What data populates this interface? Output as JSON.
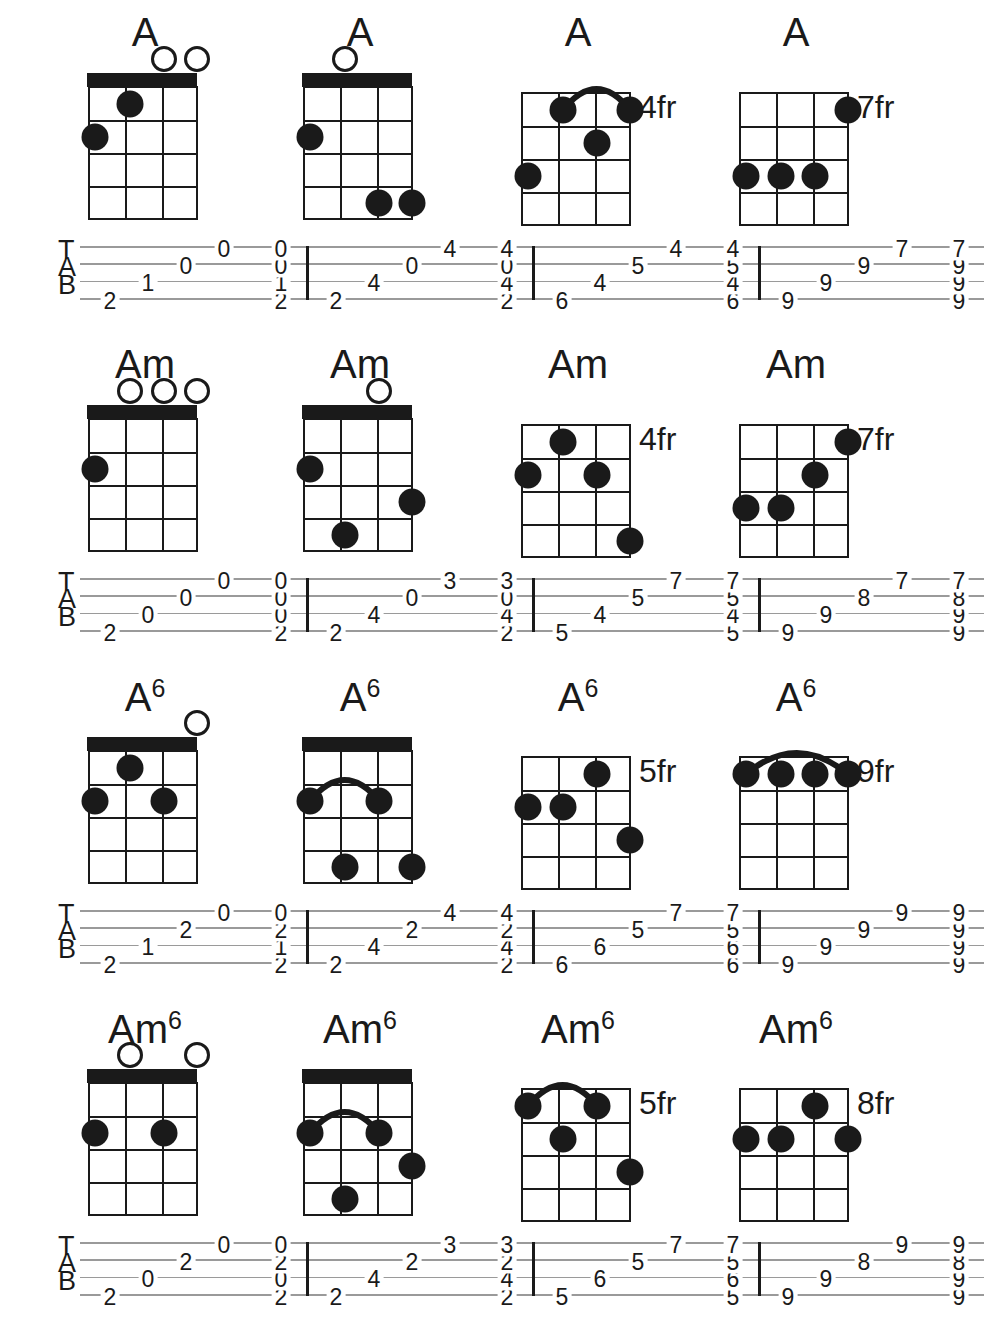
{
  "document": {
    "instrument_strings": 4,
    "diagram_frets": 4,
    "tab_letters": [
      "T",
      "A",
      "B"
    ],
    "colors": {
      "ink": "#1a1a1a",
      "staff_line": "#9a9a9a",
      "paper": "#ffffff"
    }
  },
  "rows": [
    {
      "name": "A-chord-row",
      "chords": [
        {
          "label": "A",
          "superscript": "",
          "position_label": "",
          "nut": true,
          "barre": null,
          "open_strings": [
            2,
            1
          ],
          "dots": [
            {
              "string": 4,
              "fret": 2
            },
            {
              "string": 3,
              "fret": 1
            }
          ],
          "tab": {
            "arpeggio": [
              2,
              1,
              0,
              0
            ],
            "block": [
              2,
              1,
              0,
              0
            ]
          }
        },
        {
          "label": "A",
          "superscript": "",
          "position_label": "",
          "nut": true,
          "barre": null,
          "open_strings": [
            3
          ],
          "dots": [
            {
              "string": 4,
              "fret": 2
            },
            {
              "string": 2,
              "fret": 4
            },
            {
              "string": 1,
              "fret": 4
            }
          ],
          "tab": {
            "arpeggio": [
              2,
              4,
              0,
              4
            ],
            "block": [
              2,
              4,
              0,
              4
            ]
          }
        },
        {
          "label": "A",
          "superscript": "",
          "position_label": "4fr",
          "nut": false,
          "barre": {
            "from_string": 3,
            "to_string": 1,
            "fret": 1
          },
          "open_strings": [],
          "dots": [
            {
              "string": 4,
              "fret": 3
            },
            {
              "string": 3,
              "fret": 1
            },
            {
              "string": 2,
              "fret": 2
            },
            {
              "string": 1,
              "fret": 1
            }
          ],
          "tab": {
            "arpeggio": [
              6,
              4,
              5,
              4
            ],
            "block": [
              6,
              4,
              5,
              4
            ]
          }
        },
        {
          "label": "A",
          "superscript": "",
          "position_label": "7fr",
          "nut": false,
          "barre": null,
          "open_strings": [],
          "dots": [
            {
              "string": 4,
              "fret": 3
            },
            {
              "string": 3,
              "fret": 3
            },
            {
              "string": 2,
              "fret": 3
            },
            {
              "string": 1,
              "fret": 1
            }
          ],
          "tab": {
            "arpeggio": [
              9,
              9,
              9,
              7
            ],
            "block": [
              9,
              9,
              9,
              7
            ]
          }
        }
      ]
    },
    {
      "name": "Am-chord-row",
      "chords": [
        {
          "label": "Am",
          "superscript": "",
          "position_label": "",
          "nut": true,
          "barre": null,
          "open_strings": [
            3,
            2,
            1
          ],
          "dots": [
            {
              "string": 4,
              "fret": 2
            }
          ],
          "tab": {
            "arpeggio": [
              2,
              0,
              0,
              0
            ],
            "block": [
              2,
              0,
              0,
              0
            ]
          }
        },
        {
          "label": "Am",
          "superscript": "",
          "position_label": "",
          "nut": true,
          "barre": null,
          "open_strings": [
            2
          ],
          "dots": [
            {
              "string": 4,
              "fret": 2
            },
            {
              "string": 3,
              "fret": 4
            },
            {
              "string": 1,
              "fret": 3
            }
          ],
          "tab": {
            "arpeggio": [
              2,
              4,
              0,
              3
            ],
            "block": [
              2,
              4,
              0,
              3
            ]
          }
        },
        {
          "label": "Am",
          "superscript": "",
          "position_label": "4fr",
          "nut": false,
          "barre": null,
          "open_strings": [],
          "dots": [
            {
              "string": 4,
              "fret": 2
            },
            {
              "string": 3,
              "fret": 1
            },
            {
              "string": 2,
              "fret": 2
            },
            {
              "string": 1,
              "fret": 4
            }
          ],
          "tab": {
            "arpeggio": [
              5,
              4,
              5,
              7
            ],
            "block": [
              5,
              4,
              5,
              7
            ]
          }
        },
        {
          "label": "Am",
          "superscript": "",
          "position_label": "7fr",
          "nut": false,
          "barre": null,
          "open_strings": [],
          "dots": [
            {
              "string": 4,
              "fret": 3
            },
            {
              "string": 3,
              "fret": 3
            },
            {
              "string": 2,
              "fret": 2
            },
            {
              "string": 1,
              "fret": 1
            }
          ],
          "tab": {
            "arpeggio": [
              9,
              9,
              8,
              7
            ],
            "block": [
              9,
              9,
              8,
              7
            ]
          }
        }
      ]
    },
    {
      "name": "A6-chord-row",
      "chords": [
        {
          "label": "A",
          "superscript": "6",
          "position_label": "",
          "nut": true,
          "barre": null,
          "open_strings": [
            1
          ],
          "dots": [
            {
              "string": 4,
              "fret": 2
            },
            {
              "string": 3,
              "fret": 1
            },
            {
              "string": 2,
              "fret": 2
            }
          ],
          "tab": {
            "arpeggio": [
              2,
              1,
              2,
              0
            ],
            "block": [
              2,
              1,
              2,
              0
            ]
          }
        },
        {
          "label": "A",
          "superscript": "6",
          "position_label": "",
          "nut": true,
          "barre": {
            "from_string": 4,
            "to_string": 2,
            "fret": 2
          },
          "open_strings": [],
          "dots": [
            {
              "string": 4,
              "fret": 2
            },
            {
              "string": 3,
              "fret": 4
            },
            {
              "string": 2,
              "fret": 2
            },
            {
              "string": 1,
              "fret": 4
            }
          ],
          "tab": {
            "arpeggio": [
              2,
              4,
              2,
              4
            ],
            "block": [
              2,
              4,
              2,
              4
            ]
          }
        },
        {
          "label": "A",
          "superscript": "6",
          "position_label": "5fr",
          "nut": false,
          "barre": null,
          "open_strings": [],
          "dots": [
            {
              "string": 4,
              "fret": 2
            },
            {
              "string": 3,
              "fret": 2
            },
            {
              "string": 2,
              "fret": 1
            },
            {
              "string": 1,
              "fret": 3
            }
          ],
          "tab": {
            "arpeggio": [
              6,
              6,
              5,
              7
            ],
            "block": [
              6,
              6,
              5,
              7
            ]
          }
        },
        {
          "label": "A",
          "superscript": "6",
          "position_label": "9fr",
          "nut": false,
          "barre": {
            "from_string": 4,
            "to_string": 1,
            "fret": 1
          },
          "open_strings": [],
          "dots": [
            {
              "string": 4,
              "fret": 1
            },
            {
              "string": 3,
              "fret": 1
            },
            {
              "string": 2,
              "fret": 1
            },
            {
              "string": 1,
              "fret": 1
            }
          ],
          "tab": {
            "arpeggio": [
              9,
              9,
              9,
              9
            ],
            "block": [
              9,
              9,
              9,
              9
            ]
          }
        }
      ]
    },
    {
      "name": "Am6-chord-row",
      "chords": [
        {
          "label": "Am",
          "superscript": "6",
          "position_label": "",
          "nut": true,
          "barre": null,
          "open_strings": [
            3,
            1
          ],
          "dots": [
            {
              "string": 4,
              "fret": 2
            },
            {
              "string": 2,
              "fret": 2
            }
          ],
          "tab": {
            "arpeggio": [
              2,
              0,
              2,
              0
            ],
            "block": [
              2,
              0,
              2,
              0
            ]
          }
        },
        {
          "label": "Am",
          "superscript": "6",
          "position_label": "",
          "nut": true,
          "barre": {
            "from_string": 4,
            "to_string": 2,
            "fret": 2
          },
          "open_strings": [],
          "dots": [
            {
              "string": 4,
              "fret": 2
            },
            {
              "string": 3,
              "fret": 4
            },
            {
              "string": 2,
              "fret": 2
            },
            {
              "string": 1,
              "fret": 3
            }
          ],
          "tab": {
            "arpeggio": [
              2,
              4,
              2,
              3
            ],
            "block": [
              2,
              4,
              2,
              3
            ]
          }
        },
        {
          "label": "Am",
          "superscript": "6",
          "position_label": "5fr",
          "nut": false,
          "barre": {
            "from_string": 4,
            "to_string": 2,
            "fret": 1
          },
          "open_strings": [],
          "dots": [
            {
              "string": 4,
              "fret": 1
            },
            {
              "string": 3,
              "fret": 2
            },
            {
              "string": 2,
              "fret": 1
            },
            {
              "string": 1,
              "fret": 3
            }
          ],
          "tab": {
            "arpeggio": [
              5,
              6,
              5,
              7
            ],
            "block": [
              5,
              6,
              5,
              7
            ]
          }
        },
        {
          "label": "Am",
          "superscript": "6",
          "position_label": "8fr",
          "nut": false,
          "barre": null,
          "open_strings": [],
          "dots": [
            {
              "string": 4,
              "fret": 2
            },
            {
              "string": 3,
              "fret": 2
            },
            {
              "string": 2,
              "fret": 1
            },
            {
              "string": 1,
              "fret": 2
            }
          ],
          "tab": {
            "arpeggio": [
              9,
              9,
              8,
              9
            ],
            "block": [
              9,
              9,
              8,
              9
            ]
          }
        }
      ]
    }
  ]
}
